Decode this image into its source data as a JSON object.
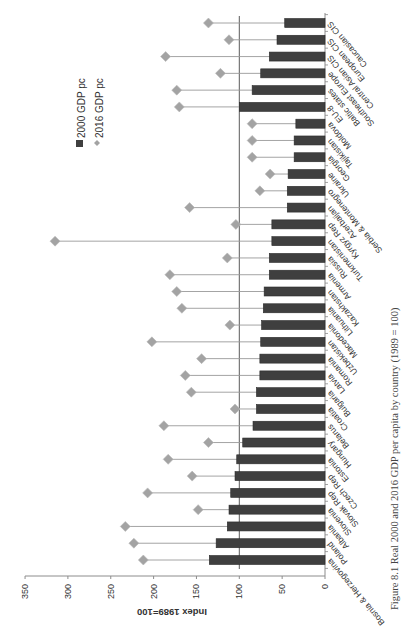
{
  "figure": {
    "caption": "Figure 8.1  Real 2000 and 2016 GDP per capita by country (1989 = 100)"
  },
  "colors": {
    "bar": "#3f3f3f",
    "bar_edge": "#2a2a2a",
    "marker": "#a3a3a3",
    "connector": "#9a9a9a",
    "axis": "#8c8c8c",
    "reference_line": "#5a5a5a",
    "text": "#333333"
  },
  "chart_data": {
    "type": "bar",
    "orientation": "rotated 90° clockwise (value axis horizontal along left/bottom edge, categories stacked vertically)",
    "title": "",
    "ylabel": "Index 1989=100",
    "xlabel": "",
    "ylim": [
      0,
      350
    ],
    "yticks": [
      0,
      50,
      100,
      150,
      200,
      250,
      300,
      350
    ],
    "reference_line": 100,
    "grid": false,
    "legend": {
      "position": "upper area (rotated)",
      "entries": [
        "2000 GDP pc",
        "2016 GDP pc"
      ]
    },
    "categories": [
      "Bosnia & Herzegovina",
      "Poland",
      "Albania",
      "Slovenia",
      "Slovak Rep",
      "Czech Rep",
      "Estonia",
      "Hungary",
      "Belarus",
      "Croatia",
      "Bulgaria",
      "Latvia",
      "Romania",
      "Uzbekistan",
      "Macedonia",
      "Lithuania",
      "Kazakhstan",
      "Armenia",
      "Russia",
      "Turkmenistan",
      "Kyrgyz Rep",
      "Azerbaijan",
      "Serbia & Montenegro",
      "Ukraine",
      "Georgia",
      "Tajikistan",
      "Moldova",
      "EU-8",
      "Baltic states",
      "Southeast Europe",
      "Central Asian CIS",
      "European CIS",
      "Caucasian CIS"
    ],
    "series": [
      {
        "name": "2000 GDP pc",
        "type": "bar",
        "values": [
          135,
          127,
          114,
          112,
          110,
          105,
          103,
          96,
          84,
          80,
          80,
          76,
          76,
          75,
          74,
          72,
          71,
          65,
          65,
          62,
          62,
          44,
          44,
          43,
          36,
          36,
          34,
          100,
          85,
          75,
          65,
          56,
          47
        ]
      },
      {
        "name": "2016 GDP pc",
        "type": "scatter-diamond",
        "values": [
          212,
          223,
          233,
          148,
          207,
          155,
          183,
          136,
          188,
          105,
          156,
          163,
          144,
          202,
          111,
          167,
          173,
          181,
          114,
          315,
          104,
          158,
          76,
          64,
          85,
          85,
          85,
          170,
          173,
          122,
          186,
          112,
          136
        ]
      }
    ]
  }
}
